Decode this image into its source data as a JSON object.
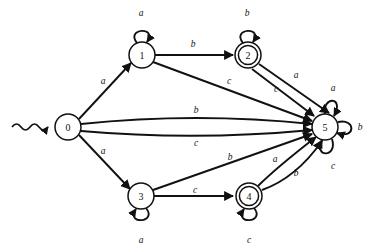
{
  "diagram": {
    "type": "state-transition-diagram",
    "alphabet": [
      "a",
      "b",
      "c"
    ],
    "start_state": "0",
    "accepting_states": [
      "2",
      "4"
    ],
    "states": [
      {
        "id": "s0",
        "label": "0",
        "x": 68,
        "y": 127,
        "r": 13,
        "accepting": false,
        "start": true
      },
      {
        "id": "s1",
        "label": "1",
        "x": 142,
        "y": 55,
        "r": 13,
        "accepting": false,
        "start": false
      },
      {
        "id": "s2",
        "label": "2",
        "x": 248,
        "y": 55,
        "r": 13,
        "accepting": true,
        "start": false
      },
      {
        "id": "s3",
        "label": "3",
        "x": 141,
        "y": 196,
        "r": 13,
        "accepting": false,
        "start": false
      },
      {
        "id": "s4",
        "label": "4",
        "x": 249,
        "y": 196,
        "r": 13,
        "accepting": true,
        "start": false
      },
      {
        "id": "s5",
        "label": "5",
        "x": 325,
        "y": 127,
        "r": 13,
        "accepting": false,
        "start": false
      }
    ],
    "transitions": [
      {
        "from": "0",
        "to": "1",
        "symbol": "a",
        "label_x": 103,
        "label_y": 81
      },
      {
        "from": "0",
        "to": "3",
        "symbol": "a",
        "label_x": 103,
        "label_y": 151
      },
      {
        "from": "0",
        "to": "5",
        "symbol": "b",
        "label_x": 196,
        "label_y": 110
      },
      {
        "from": "0",
        "to": "5",
        "symbol": "c",
        "label_x": 196,
        "label_y": 143
      },
      {
        "from": "1",
        "to": "1",
        "symbol": "a",
        "label_x": 141,
        "label_y": 13
      },
      {
        "from": "1",
        "to": "2",
        "symbol": "b",
        "label_x": 193,
        "label_y": 44
      },
      {
        "from": "1",
        "to": "5",
        "symbol": "c",
        "label_x": 229,
        "label_y": 81
      },
      {
        "from": "2",
        "to": "2",
        "symbol": "b",
        "label_x": 247,
        "label_y": 13
      },
      {
        "from": "2",
        "to": "5",
        "symbol": "a",
        "label_x": 296,
        "label_y": 75
      },
      {
        "from": "2",
        "to": "5",
        "symbol": "c",
        "label_x": 276,
        "label_y": 89
      },
      {
        "from": "3",
        "to": "3",
        "symbol": "a",
        "label_x": 141,
        "label_y": 240
      },
      {
        "from": "3",
        "to": "4",
        "symbol": "c",
        "label_x": 195,
        "label_y": 190
      },
      {
        "from": "3",
        "to": "5",
        "symbol": "b",
        "label_x": 230,
        "label_y": 157
      },
      {
        "from": "4",
        "to": "4",
        "symbol": "c",
        "label_x": 249,
        "label_y": 240
      },
      {
        "from": "4",
        "to": "5",
        "symbol": "a",
        "label_x": 275,
        "label_y": 159
      },
      {
        "from": "4",
        "to": "5",
        "symbol": "b",
        "label_x": 296,
        "label_y": 173
      },
      {
        "from": "5",
        "to": "5",
        "symbol": "a",
        "label_x": 333,
        "label_y": 88
      },
      {
        "from": "5",
        "to": "5",
        "symbol": "b",
        "label_x": 360,
        "label_y": 127
      },
      {
        "from": "5",
        "to": "5",
        "symbol": "c",
        "label_x": 333,
        "label_y": 166
      }
    ],
    "colors": {
      "stroke": "#111111",
      "fill": "#ffffff",
      "background": "#ffffff"
    }
  }
}
